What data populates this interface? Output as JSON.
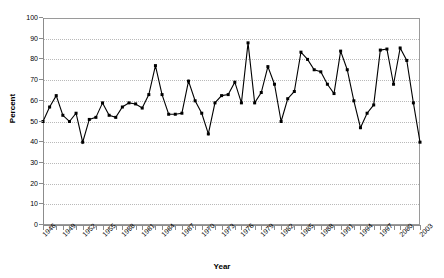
{
  "chart_data": {
    "type": "line",
    "title": "",
    "xlabel": "Year",
    "ylabel": "Percent",
    "ylim": [
      0,
      100
    ],
    "ytick_step": 10,
    "yticks": [
      0,
      10,
      20,
      30,
      40,
      50,
      60,
      70,
      80,
      90,
      100
    ],
    "xlim": [
      1946,
      2003
    ],
    "xtick_labels": [
      "1946",
      "1949",
      "1952",
      "1955",
      "1958",
      "1961",
      "1964",
      "1967",
      "1970",
      "1973",
      "1976",
      "1979",
      "1982",
      "1985",
      "1988",
      "1991",
      "1994",
      "1997",
      "2000",
      "2003"
    ],
    "xtick_label_step": 3,
    "grid": "horizontal-dotted",
    "legend": "none",
    "marker": "square",
    "line_color": "#000000",
    "grid_color": "#b9b9b9",
    "axis_color": "#8c8c8c",
    "x": [
      1946,
      1947,
      1948,
      1949,
      1950,
      1951,
      1952,
      1953,
      1954,
      1955,
      1956,
      1957,
      1958,
      1959,
      1960,
      1961,
      1962,
      1963,
      1964,
      1965,
      1966,
      1967,
      1968,
      1969,
      1970,
      1971,
      1972,
      1973,
      1974,
      1975,
      1976,
      1977,
      1978,
      1979,
      1980,
      1981,
      1982,
      1983,
      1984,
      1985,
      1986,
      1987,
      1988,
      1989,
      1990,
      1991,
      1992,
      1993,
      1994,
      1995,
      1996,
      1997,
      1998,
      1999,
      2000,
      2001,
      2002,
      2003
    ],
    "values": [
      50,
      57,
      62.5,
      53,
      50,
      54,
      40,
      51,
      52,
      59,
      53,
      52,
      57,
      59,
      58.5,
      56.5,
      63,
      77,
      63,
      53.5,
      53.5,
      54,
      69.5,
      60,
      54,
      44,
      59,
      62.5,
      63,
      69,
      59,
      88,
      59,
      64,
      76.5,
      68,
      50,
      61,
      64.5,
      83.5,
      80,
      75,
      74,
      68,
      63.5,
      84,
      75,
      60,
      47,
      54,
      58,
      84.5,
      85,
      68,
      85.5,
      79.5,
      59,
      40
    ],
    "values_note": "Percent by year, read from plot"
  },
  "axes": {
    "y_title": "Percent",
    "x_title": "Year"
  }
}
